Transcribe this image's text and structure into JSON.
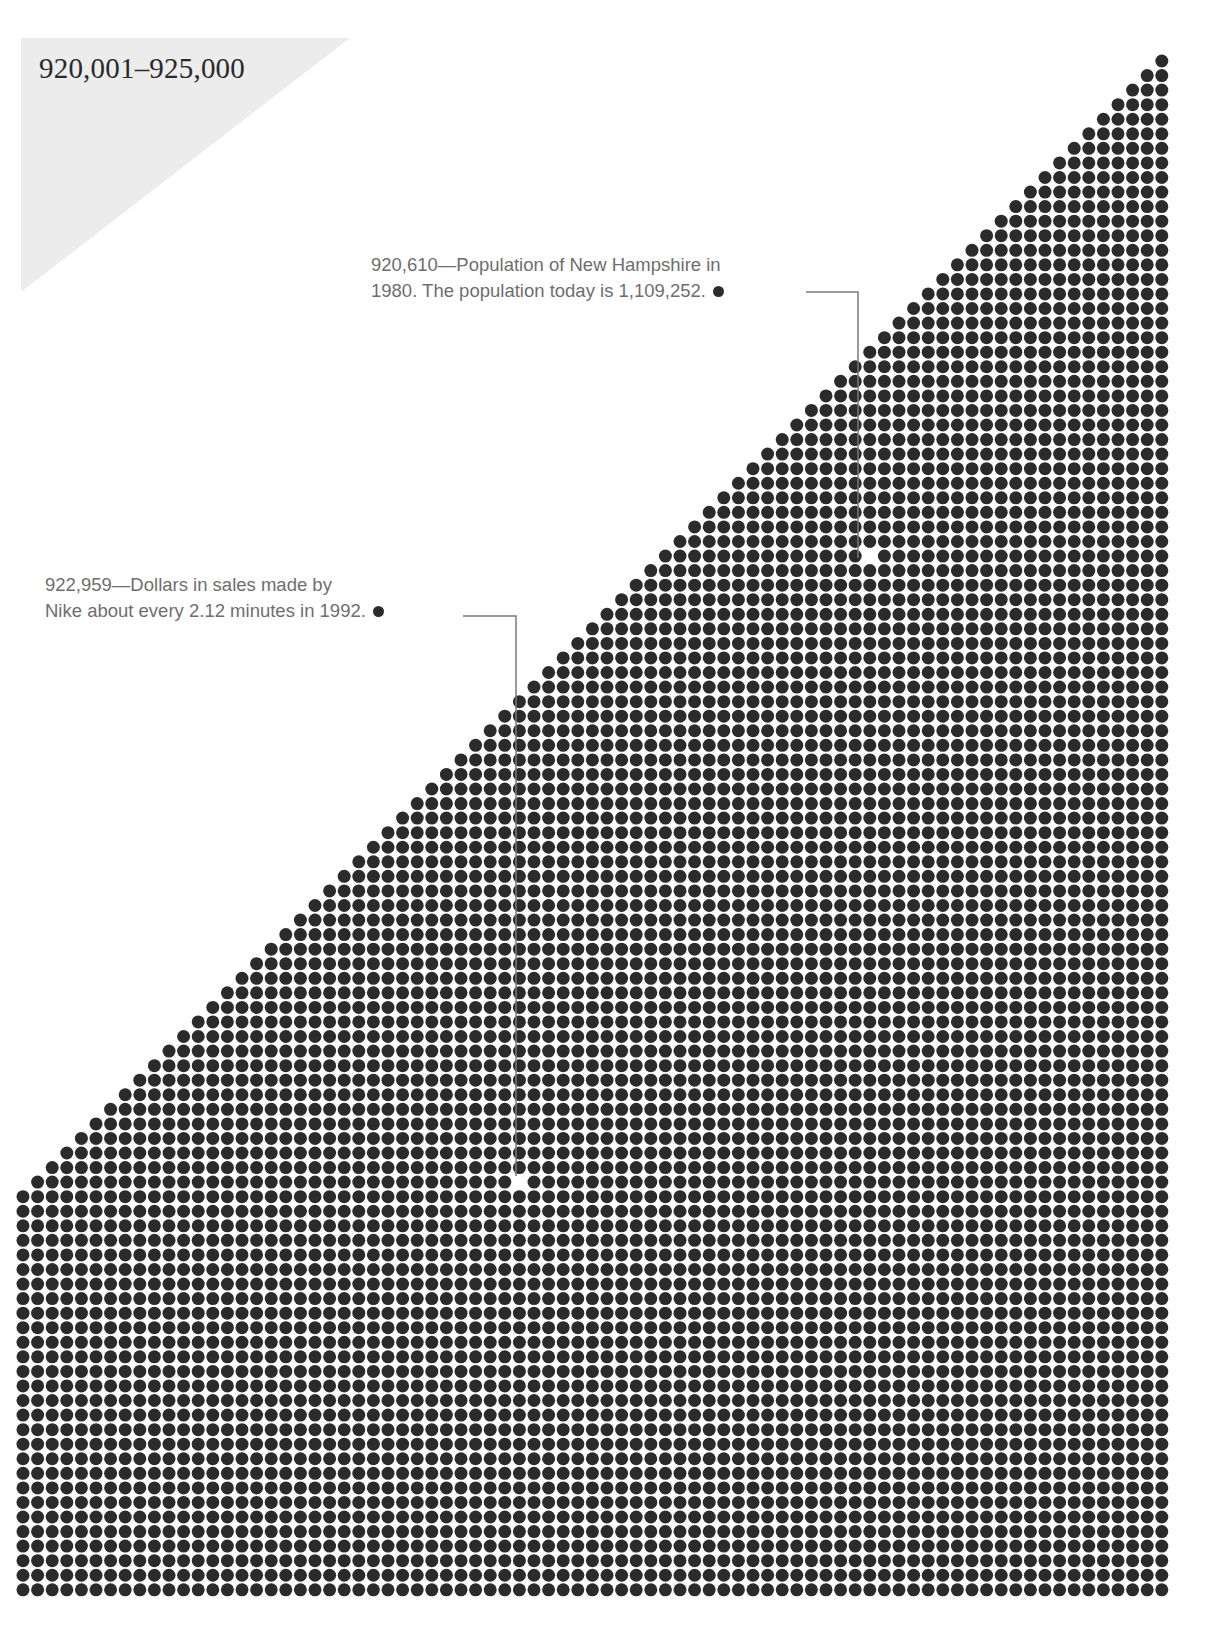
{
  "page": {
    "range_title": "920,001–925,000"
  },
  "annotations": [
    {
      "id": "new-hampshire",
      "line1": "920,610—Population of New Hampshire in",
      "line2": "1980. The population today is 1,109,252.",
      "value": 920610
    },
    {
      "id": "nike",
      "line1": "922,959—Dollars in sales made by",
      "line2": "Nike about every 2.12 minutes in 1992.",
      "value": 922959
    }
  ],
  "colors": {
    "dot": "#2b2b2b",
    "leader_line": "#7a7a7a",
    "annotation_text": "#6e6e6e",
    "title_text": "#2a2a2a",
    "corner_triangle": "#ececec",
    "background": "#ffffff"
  },
  "chart_data": {
    "type": "dot-matrix",
    "title": "920,001–925,000",
    "range_start": 920001,
    "range_end": 925000,
    "grid": {
      "columns": 79,
      "rows": 106,
      "origin_x": 23,
      "origin_y": 61,
      "pitch_x": 14.6,
      "pitch_y": 14.56,
      "dot_diameter": 13,
      "staircase": "right-aligned; row r (0-based) shows min(r+1, 79) dots"
    },
    "highlights": [
      {
        "value": 920610,
        "label": "Population of New Hampshire in 1980. The population today is 1,109,252.",
        "gap_col": 58,
        "gap_row": 34
      },
      {
        "value": 922959,
        "label": "Dollars in sales made by Nike about every 2.12 minutes in 1992.",
        "gap_col": 34,
        "gap_row": 77
      }
    ]
  }
}
